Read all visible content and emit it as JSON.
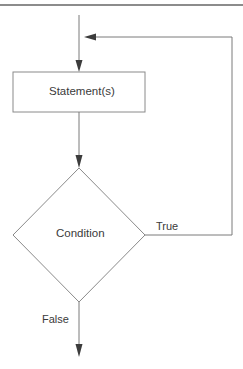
{
  "diagram": {
    "type": "flowchart",
    "title": "",
    "nodes": [
      {
        "id": "statement",
        "shape": "rectangle",
        "label": "Statement(s)"
      },
      {
        "id": "condition",
        "shape": "diamond",
        "label": "Condition"
      }
    ],
    "edges": [
      {
        "from": "entry",
        "to": "statement",
        "label": ""
      },
      {
        "from": "statement",
        "to": "condition",
        "label": ""
      },
      {
        "from": "condition",
        "to": "statement",
        "label": "True",
        "loop": true
      },
      {
        "from": "condition",
        "to": "exit",
        "label": "False"
      }
    ],
    "colors": {
      "line": "#7a7a7a",
      "arrow": "#3c3c3c",
      "text": "#3a3a3a",
      "border_top": "#8c8c8c"
    }
  },
  "labels": {
    "statement": "Statement(s)",
    "condition": "Condition",
    "true_branch": "True",
    "false_branch": "False"
  }
}
